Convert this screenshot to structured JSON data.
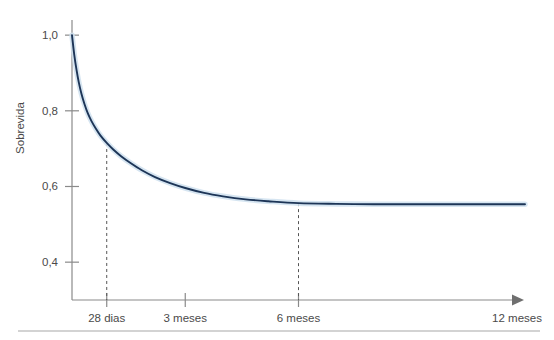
{
  "chart_data": {
    "type": "line",
    "title": "",
    "xlabel": "",
    "ylabel": "Sobrevida",
    "ylim": [
      0.3,
      1.04
    ],
    "xlim": [
      0,
      12
    ],
    "grid": false,
    "legend": null,
    "y_ticks": [
      "1,0",
      "0,8",
      "0,6",
      "0,4"
    ],
    "y_tick_values": [
      1.0,
      0.8,
      0.6,
      0.4
    ],
    "x_ticks": [
      "28 dias",
      "3 meses",
      "6 meses",
      "12 meses"
    ],
    "x_tick_values": [
      0.92,
      3,
      6,
      12
    ],
    "series": [
      {
        "name": "Sobrevida",
        "color": "#1d3557",
        "halo_color": "#cfe0ef",
        "x": [
          0.0,
          0.06,
          0.12,
          0.18,
          0.25,
          0.33,
          0.42,
          0.52,
          0.63,
          0.75,
          0.92,
          1.1,
          1.3,
          1.55,
          1.85,
          2.2,
          2.6,
          3.0,
          3.5,
          4.0,
          4.6,
          5.2,
          6.0,
          7.0,
          8.0,
          9.0,
          10.0,
          11.0,
          12.0
        ],
        "y": [
          1.0,
          0.948,
          0.908,
          0.875,
          0.845,
          0.818,
          0.793,
          0.772,
          0.753,
          0.735,
          0.715,
          0.697,
          0.68,
          0.662,
          0.643,
          0.625,
          0.609,
          0.596,
          0.583,
          0.574,
          0.566,
          0.561,
          0.556,
          0.554,
          0.553,
          0.553,
          0.553,
          0.553,
          0.553
        ]
      }
    ],
    "annotations": [
      {
        "name": "dashed-drop-28-dias",
        "x": 0.92,
        "y_top": 0.715,
        "y_bottom": 0.3
      },
      {
        "name": "dashed-drop-6-meses",
        "x": 6.0,
        "y_top": 0.556,
        "y_bottom": 0.3
      }
    ],
    "axis_arrow": true,
    "colors": {
      "curve": "#1d3557",
      "curve_halo": "#cfe0ef",
      "axis": "#8a8a8a",
      "text": "#4a4a4a",
      "rule": "#a8a8a8"
    }
  },
  "figure": {
    "bottom_rule": true
  }
}
